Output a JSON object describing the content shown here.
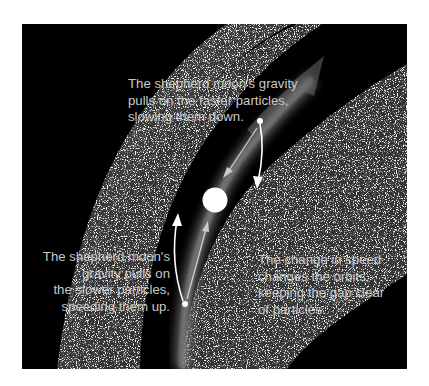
{
  "diagram": {
    "background_color": "#000000",
    "ring_color": "#bfbfbf",
    "gap_glow_color": "#5a5a5a",
    "moon_color": "#ffffff",
    "labels": {
      "top": {
        "lines": [
          "The shepherd moon's gravity",
          "pulls on the faster particles,",
          "slowing them down."
        ]
      },
      "left": {
        "lines": [
          "The shepherd moon's",
          "gravity pulls on",
          "the slower particles,",
          "speeding them up."
        ]
      },
      "right": {
        "lines": [
          "The change in speed",
          "changes the orbits,",
          "keeping the gap clear",
          "of particles."
        ]
      }
    },
    "elements": {
      "inner_ring": "particle ring band (left)",
      "outer_ring": "particle ring band (right)",
      "gap": "dark gap with glowing orbit path",
      "orbit_arrow": "large translucent arrow showing orbit direction",
      "moon": "shepherd moon",
      "fast_particle": "particle above moon (faster)",
      "slow_particle": "particle below moon (slower)"
    }
  }
}
